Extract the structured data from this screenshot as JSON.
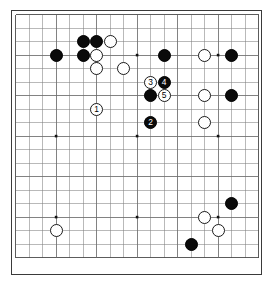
{
  "diagram": {
    "kind": "go-board-diagram",
    "board_size": 19,
    "visible_region": {
      "cols": 19,
      "rows": 19
    },
    "geometry": {
      "origin_x": 15.6,
      "origin_y": 14.6,
      "step": 13.5,
      "stone_diameter": 13.2,
      "star_point_radius": 1.3
    },
    "colors": {
      "board": "#ffffff",
      "line": "#808080",
      "line_strong": "#4a4a4a",
      "frame": "#3a3a3a",
      "black_stone": "#0a0a0a",
      "white_stone": "#ffffff",
      "white_stone_edge": "#1a1a1a",
      "black_label_text": "#ffffff",
      "white_label_text": "#000000"
    },
    "star_points": [
      {
        "col": 3,
        "row": 3
      },
      {
        "col": 9,
        "row": 3
      },
      {
        "col": 15,
        "row": 3
      },
      {
        "col": 3,
        "row": 9
      },
      {
        "col": 9,
        "row": 9
      },
      {
        "col": 15,
        "row": 9
      },
      {
        "col": 3,
        "row": 15
      },
      {
        "col": 9,
        "row": 15
      },
      {
        "col": 15,
        "row": 15
      }
    ],
    "stones": [
      {
        "col": 3,
        "row": 3,
        "color": "black",
        "label": ""
      },
      {
        "col": 5,
        "row": 2,
        "color": "black",
        "label": ""
      },
      {
        "col": 6,
        "row": 2,
        "color": "black",
        "label": ""
      },
      {
        "col": 7,
        "row": 2,
        "color": "white",
        "label": ""
      },
      {
        "col": 5,
        "row": 3,
        "color": "black",
        "label": ""
      },
      {
        "col": 6,
        "row": 3,
        "color": "white",
        "label": ""
      },
      {
        "col": 6,
        "row": 4,
        "color": "white",
        "label": ""
      },
      {
        "col": 8,
        "row": 4,
        "color": "white",
        "label": ""
      },
      {
        "col": 11,
        "row": 3,
        "color": "black",
        "label": ""
      },
      {
        "col": 14,
        "row": 3,
        "color": "white",
        "label": ""
      },
      {
        "col": 16,
        "row": 3,
        "color": "black",
        "label": ""
      },
      {
        "col": 10,
        "row": 5,
        "color": "white",
        "label": "3"
      },
      {
        "col": 11,
        "row": 5,
        "color": "black",
        "label": "4"
      },
      {
        "col": 10,
        "row": 6,
        "color": "black",
        "label": ""
      },
      {
        "col": 11,
        "row": 6,
        "color": "white",
        "label": "5"
      },
      {
        "col": 14,
        "row": 6,
        "color": "white",
        "label": ""
      },
      {
        "col": 16,
        "row": 6,
        "color": "black",
        "label": ""
      },
      {
        "col": 6,
        "row": 7,
        "color": "white",
        "label": "1"
      },
      {
        "col": 10,
        "row": 8,
        "color": "black",
        "label": "2"
      },
      {
        "col": 14,
        "row": 8,
        "color": "white",
        "label": ""
      },
      {
        "col": 16,
        "row": 14,
        "color": "black",
        "label": ""
      },
      {
        "col": 14,
        "row": 15,
        "color": "white",
        "label": ""
      },
      {
        "col": 15,
        "row": 16,
        "color": "white",
        "label": ""
      },
      {
        "col": 3,
        "row": 16,
        "color": "white",
        "label": ""
      },
      {
        "col": 13,
        "row": 17,
        "color": "black",
        "label": ""
      }
    ],
    "move_sequence": [
      {
        "number": "1",
        "color": "white",
        "col": 6,
        "row": 7
      },
      {
        "number": "2",
        "color": "black",
        "col": 10,
        "row": 8
      },
      {
        "number": "3",
        "color": "white",
        "col": 10,
        "row": 5
      },
      {
        "number": "4",
        "color": "black",
        "col": 11,
        "row": 5
      },
      {
        "number": "5",
        "color": "white",
        "col": 11,
        "row": 6
      }
    ]
  }
}
